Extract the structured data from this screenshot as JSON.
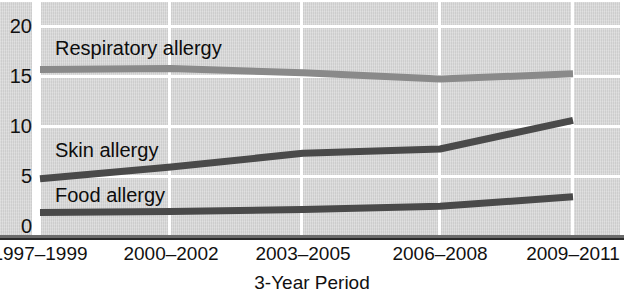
{
  "chart_data": {
    "type": "line",
    "title": "",
    "xlabel": "3-Year Period",
    "ylabel": "",
    "categories": [
      "1997–1999",
      "2000–2002",
      "2003–2005",
      "2006–2008",
      "2009–2011"
    ],
    "yticks": [
      "0",
      "5",
      "10",
      "15",
      "20"
    ],
    "ylim": [
      0,
      20
    ],
    "grid": "horizontal-and-vertical",
    "legend_position": "inline-labels",
    "series": [
      {
        "name": "Respiratory allergy",
        "color": "#8a8a8a",
        "values": [
          15.8,
          15.9,
          15.5,
          14.9,
          15.4
        ]
      },
      {
        "name": "Skin allergy",
        "color": "#4a4a4a",
        "values": [
          5.5,
          6.6,
          7.9,
          8.3,
          11.0
        ]
      },
      {
        "name": "Food allergy",
        "color": "#4a4a4a",
        "values": [
          2.3,
          2.4,
          2.6,
          2.9,
          3.8
        ]
      }
    ]
  },
  "labels": {
    "respiratory": "Respiratory allergy",
    "skin": "Skin allergy",
    "food": "Food allergy"
  },
  "yticks": {
    "t0": "0",
    "t5": "5",
    "t10": "10",
    "t15": "15",
    "t20": "20"
  },
  "xticks": {
    "x0": "1997–1999",
    "x1": "2000–2002",
    "x2": "2003–2005",
    "x3": "2006–2008",
    "x4": "2009–2011"
  },
  "axis": {
    "x_title": "3-Year Period"
  }
}
